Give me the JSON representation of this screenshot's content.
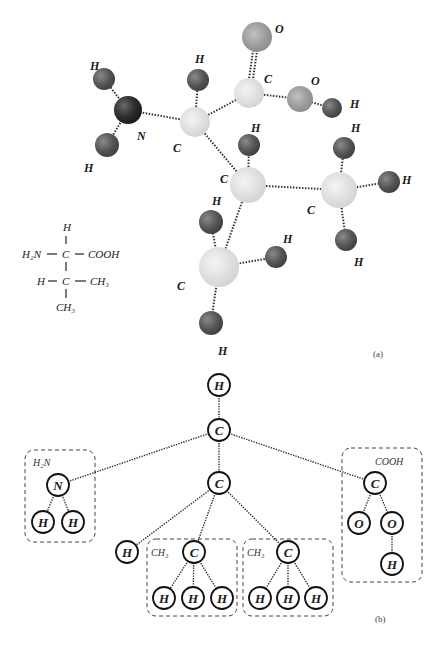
{
  "figure": {
    "caption_a": "(a)",
    "caption_b": "(b)"
  },
  "model_3d": {
    "atoms": [
      {
        "id": "N",
        "label": "N",
        "x": 128,
        "y": 110,
        "r": 14,
        "shade": "dark"
      },
      {
        "id": "H_N1",
        "label": "H",
        "x": 104,
        "y": 79,
        "r": 11,
        "shade": "mid"
      },
      {
        "id": "H_N2",
        "label": "H",
        "x": 107,
        "y": 145,
        "r": 12,
        "shade": "mid"
      },
      {
        "id": "C_alpha",
        "label": "C",
        "x": 195,
        "y": 122,
        "r": 15,
        "shade": "light"
      },
      {
        "id": "H_alpha",
        "label": "H",
        "x": 198,
        "y": 80,
        "r": 11,
        "shade": "mid"
      },
      {
        "id": "C_carboxyl",
        "label": "C",
        "x": 249,
        "y": 93,
        "r": 15,
        "shade": "light"
      },
      {
        "id": "O_double",
        "label": "O",
        "x": 257,
        "y": 37,
        "r": 15,
        "shade": "grey"
      },
      {
        "id": "O_hydroxyl",
        "label": "O",
        "x": 300,
        "y": 99,
        "r": 13,
        "shade": "grey"
      },
      {
        "id": "H_hydroxyl",
        "label": "H",
        "x": 332,
        "y": 108,
        "r": 10,
        "shade": "mid"
      },
      {
        "id": "C_beta",
        "label": "C",
        "x": 248,
        "y": 185,
        "r": 18,
        "shade": "light"
      },
      {
        "id": "H_beta",
        "label": "H",
        "x": 249,
        "y": 145,
        "r": 11,
        "shade": "mid"
      },
      {
        "id": "C_gamma1",
        "label": "C",
        "x": 339,
        "y": 190,
        "r": 18,
        "shade": "light"
      },
      {
        "id": "H_g1a",
        "label": "H",
        "x": 344,
        "y": 148,
        "r": 11,
        "shade": "mid"
      },
      {
        "id": "H_g1b",
        "label": "H",
        "x": 389,
        "y": 182,
        "r": 11,
        "shade": "mid"
      },
      {
        "id": "H_g1c",
        "label": "H",
        "x": 346,
        "y": 240,
        "r": 11,
        "shade": "mid"
      },
      {
        "id": "C_gamma2",
        "label": "C",
        "x": 219,
        "y": 267,
        "r": 20,
        "shade": "light"
      },
      {
        "id": "H_g2a",
        "label": "H",
        "x": 211,
        "y": 222,
        "r": 12,
        "shade": "mid"
      },
      {
        "id": "H_g2b",
        "label": "H",
        "x": 276,
        "y": 257,
        "r": 11,
        "shade": "mid"
      },
      {
        "id": "H_g2c",
        "label": "H",
        "x": 211,
        "y": 323,
        "r": 12,
        "shade": "mid"
      }
    ],
    "labels": [
      {
        "text": "H",
        "x": 90,
        "y": 70
      },
      {
        "text": "H",
        "x": 84,
        "y": 172
      },
      {
        "text": "N",
        "x": 137,
        "y": 140
      },
      {
        "text": "H",
        "x": 195,
        "y": 63
      },
      {
        "text": "C",
        "x": 173,
        "y": 152
      },
      {
        "text": "O",
        "x": 275,
        "y": 33
      },
      {
        "text": "C",
        "x": 264,
        "y": 83
      },
      {
        "text": "O",
        "x": 311,
        "y": 85
      },
      {
        "text": "H",
        "x": 350,
        "y": 108
      },
      {
        "text": "H",
        "x": 251,
        "y": 132
      },
      {
        "text": "C",
        "x": 220,
        "y": 183
      },
      {
        "text": "H",
        "x": 351,
        "y": 132
      },
      {
        "text": "C",
        "x": 307,
        "y": 214
      },
      {
        "text": "H",
        "x": 402,
        "y": 184
      },
      {
        "text": "H",
        "x": 354,
        "y": 266
      },
      {
        "text": "H",
        "x": 212,
        "y": 205
      },
      {
        "text": "H",
        "x": 283,
        "y": 243
      },
      {
        "text": "C",
        "x": 177,
        "y": 290
      },
      {
        "text": "H",
        "x": 218,
        "y": 355
      }
    ],
    "bonds": [
      [
        "N",
        "H_N1"
      ],
      [
        "N",
        "H_N2"
      ],
      [
        "N",
        "C_alpha"
      ],
      [
        "C_alpha",
        "H_alpha"
      ],
      [
        "C_alpha",
        "C_carboxyl"
      ],
      [
        "C_alpha",
        "C_beta"
      ],
      [
        "C_carboxyl",
        "O_double"
      ],
      [
        "C_carboxyl",
        "O_hydroxyl"
      ],
      [
        "O_hydroxyl",
        "H_hydroxyl"
      ],
      [
        "C_beta",
        "H_beta"
      ],
      [
        "C_beta",
        "C_gamma1"
      ],
      [
        "C_beta",
        "C_gamma2"
      ],
      [
        "C_gamma1",
        "H_g1a"
      ],
      [
        "C_gamma1",
        "H_g1b"
      ],
      [
        "C_gamma1",
        "H_g1c"
      ],
      [
        "C_gamma2",
        "H_g2a"
      ],
      [
        "C_gamma2",
        "H_g2b"
      ],
      [
        "C_gamma2",
        "H_g2c"
      ]
    ]
  },
  "structural_formula": {
    "row1_top": "H",
    "row2_left": "H₂N",
    "row2_center": "C",
    "row2_right": "COOH",
    "row3_left": "H",
    "row3_center": "C",
    "row3_right": "CH₃",
    "row4_bottom": "CH₃"
  },
  "tree": {
    "nodes": [
      {
        "id": "root_H",
        "label": "H",
        "x": 219,
        "y": 385
      },
      {
        "id": "C1",
        "label": "C",
        "x": 219,
        "y": 430
      },
      {
        "id": "N",
        "label": "N",
        "x": 58,
        "y": 485
      },
      {
        "id": "NH1",
        "label": "H",
        "x": 43,
        "y": 522
      },
      {
        "id": "NH2",
        "label": "H",
        "x": 73,
        "y": 522
      },
      {
        "id": "C2",
        "label": "C",
        "x": 219,
        "y": 483
      },
      {
        "id": "H_side",
        "label": "H",
        "x": 127,
        "y": 552
      },
      {
        "id": "CH3a_C",
        "label": "C",
        "x": 194,
        "y": 552
      },
      {
        "id": "CH3a_H1",
        "label": "H",
        "x": 164,
        "y": 598
      },
      {
        "id": "CH3a_H2",
        "label": "H",
        "x": 193,
        "y": 598
      },
      {
        "id": "CH3a_H3",
        "label": "H",
        "x": 222,
        "y": 598
      },
      {
        "id": "CH3b_C",
        "label": "C",
        "x": 288,
        "y": 552
      },
      {
        "id": "CH3b_H1",
        "label": "H",
        "x": 260,
        "y": 598
      },
      {
        "id": "CH3b_H2",
        "label": "H",
        "x": 288,
        "y": 598
      },
      {
        "id": "CH3b_H3",
        "label": "H",
        "x": 316,
        "y": 598
      },
      {
        "id": "COOH_C",
        "label": "C",
        "x": 375,
        "y": 483
      },
      {
        "id": "COOH_O1",
        "label": "O",
        "x": 359,
        "y": 523
      },
      {
        "id": "COOH_O2",
        "label": "O",
        "x": 392,
        "y": 523
      },
      {
        "id": "COOH_H",
        "label": "H",
        "x": 392,
        "y": 564
      }
    ],
    "edges": [
      [
        "root_H",
        "C1"
      ],
      [
        "C1",
        "N"
      ],
      [
        "C1",
        "C2"
      ],
      [
        "C1",
        "COOH_C"
      ],
      [
        "N",
        "NH1"
      ],
      [
        "N",
        "NH2"
      ],
      [
        "C2",
        "H_side"
      ],
      [
        "C2",
        "CH3a_C"
      ],
      [
        "C2",
        "CH3b_C"
      ],
      [
        "CH3a_C",
        "CH3a_H1"
      ],
      [
        "CH3a_C",
        "CH3a_H2"
      ],
      [
        "CH3a_C",
        "CH3a_H3"
      ],
      [
        "CH3b_C",
        "CH3b_H1"
      ],
      [
        "CH3b_C",
        "CH3b_H2"
      ],
      [
        "CH3b_C",
        "CH3b_H3"
      ],
      [
        "COOH_C",
        "COOH_O1"
      ],
      [
        "COOH_C",
        "COOH_O2"
      ],
      [
        "COOH_O2",
        "COOH_H"
      ]
    ],
    "groups": [
      {
        "id": "amino",
        "label": "H₂N",
        "x": 25,
        "y": 450,
        "w": 70,
        "h": 92,
        "label_x": 33,
        "label_y": 466
      },
      {
        "id": "methyl_a",
        "label": "CH₃",
        "x": 147,
        "y": 539,
        "w": 90,
        "h": 77,
        "label_x": 151,
        "label_y": 556
      },
      {
        "id": "methyl_b",
        "label": "CH₃",
        "x": 243,
        "y": 539,
        "w": 90,
        "h": 77,
        "label_x": 247,
        "label_y": 556
      },
      {
        "id": "carboxyl",
        "label": "COOH",
        "x": 342,
        "y": 448,
        "w": 80,
        "h": 134,
        "label_x": 375,
        "label_y": 465
      }
    ]
  }
}
